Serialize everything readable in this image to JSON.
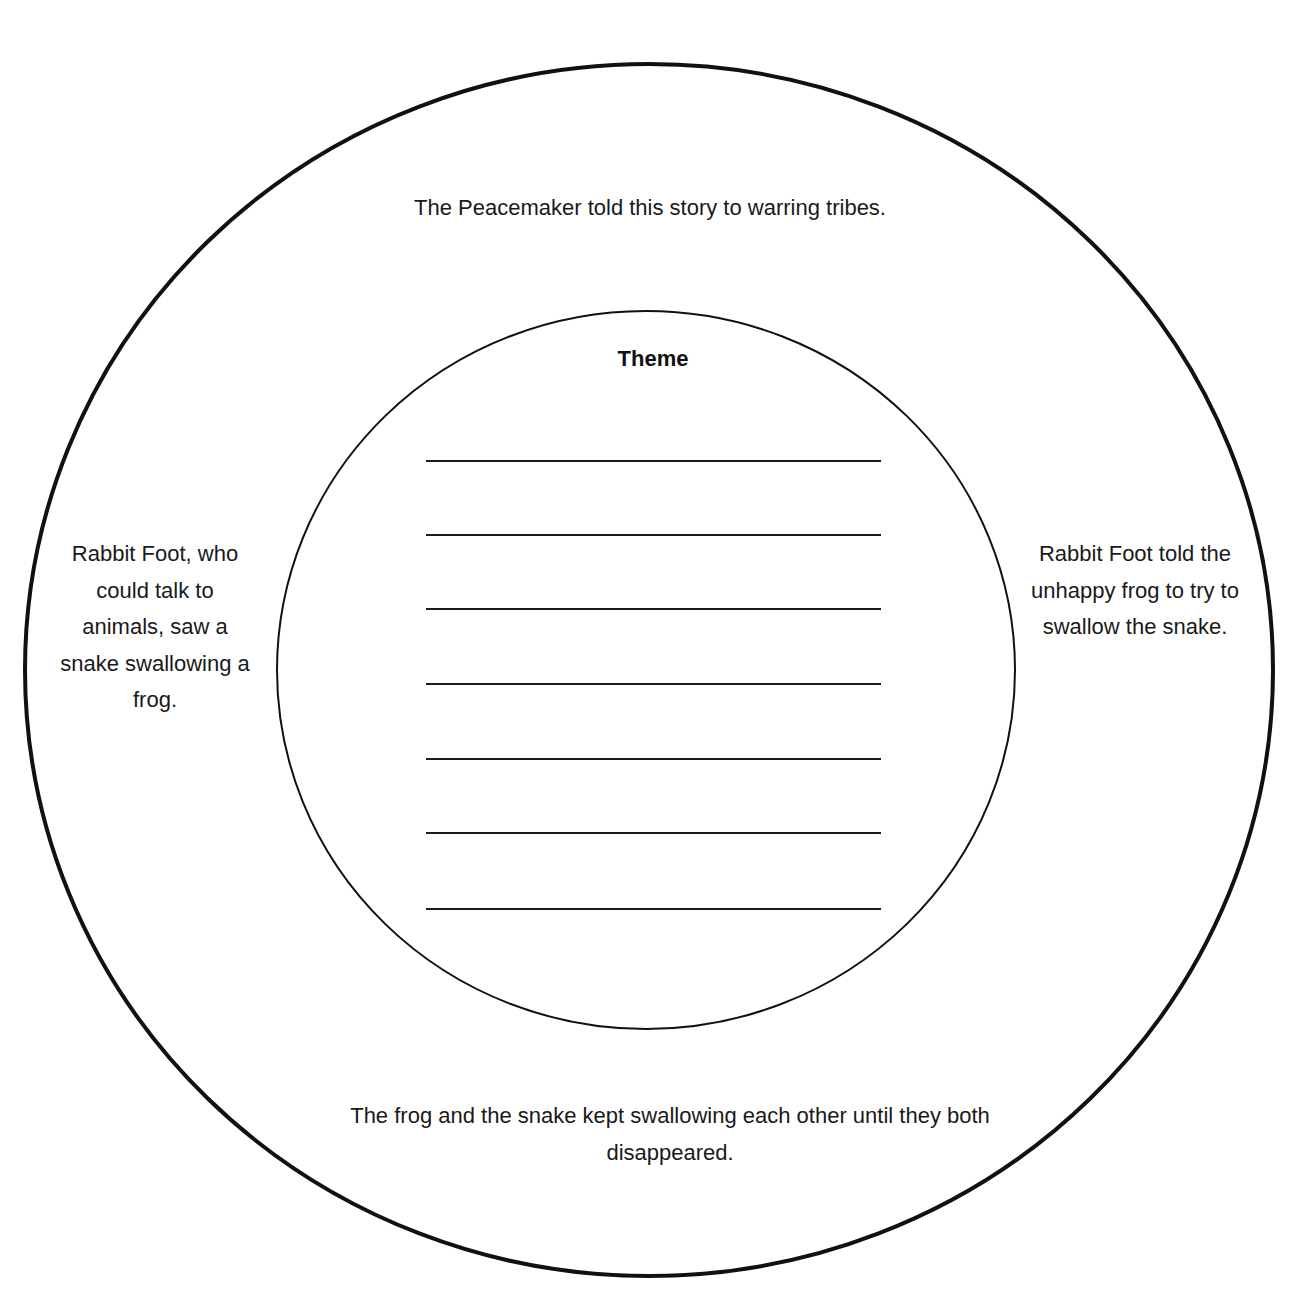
{
  "diagram": {
    "type": "concentric-circle-organizer",
    "colors": {
      "stroke": "#111111",
      "background": "#ffffff",
      "text": "#1a1a1a"
    },
    "outer_circle": {
      "top": "The Peacemaker told this story to warring tribes.",
      "left": "Rabbit Foot, who could talk to animals, saw a snake swallowing a frog.",
      "right": "Rabbit Foot told the unhappy frog to try to swallow the snake.",
      "bottom": "The frog and the snake kept swallowing each other until they both disappeared."
    },
    "inner_circle": {
      "title": "Theme",
      "answer_line_count": 7
    }
  }
}
